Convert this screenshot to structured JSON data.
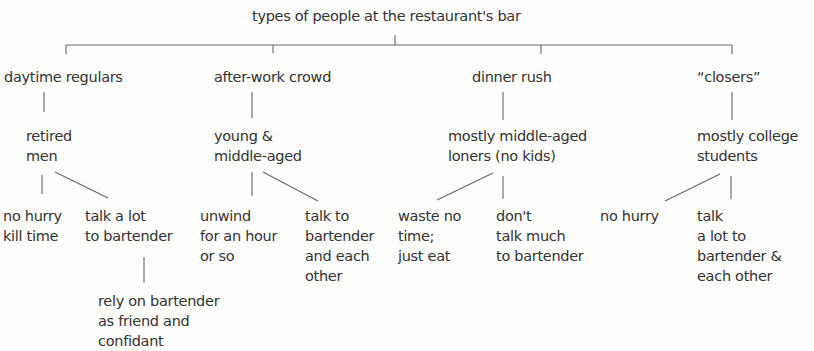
{
  "diagram": {
    "title": "types of people at the restaurant's bar",
    "groups": [
      {
        "name": "daytime regulars",
        "who": "retired\nmen",
        "traits": [
          "no hurry\nkill time",
          "talk a lot\nto bartender"
        ],
        "sub": "rely on bartender\nas friend and\nconfidant"
      },
      {
        "name": "after-work crowd",
        "who": "young &\nmiddle-aged",
        "traits": [
          "unwind\nfor an hour\nor so",
          "talk to\nbartender\nand each\nother"
        ]
      },
      {
        "name": "dinner rush",
        "who": "mostly middle-aged\nloners (no kids)",
        "traits": [
          "waste no\ntime;\njust eat",
          "don't\ntalk much\nto bartender"
        ]
      },
      {
        "name": "“closers”",
        "who": "mostly college\nstudents",
        "traits": [
          "no hurry",
          "talk\na lot to\nbartender &\neach other"
        ]
      }
    ]
  }
}
